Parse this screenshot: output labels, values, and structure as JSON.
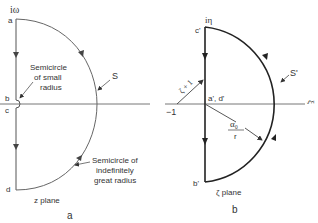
{
  "panel_a": {
    "axis_label": "iω",
    "points": {
      "a": "a",
      "b": "b",
      "c": "c",
      "d": "d"
    },
    "contour_label": "S",
    "small_semicircle_note": [
      "Semicircle",
      "of small",
      "radius"
    ],
    "great_semicircle_note": [
      "Semicircle of",
      "indefinitely",
      "great radius"
    ],
    "plane_label": "z plane",
    "caption": "a"
  },
  "panel_b": {
    "axis_label_vertical": "iη",
    "axis_label_horizontal": "ξ",
    "points": {
      "c_prime": "c'",
      "b_prime": "b'",
      "ad_prime": "a', d'"
    },
    "minus_one": "−1",
    "vector_label": "ζ + 1",
    "radius_label_num": "α₀",
    "radius_label_den": "r",
    "contour_label": "S'",
    "plane_label": "ζ plane",
    "caption": "b"
  },
  "colors": {
    "line": "#555555",
    "bold_line": "#222222",
    "text": "#333333"
  }
}
